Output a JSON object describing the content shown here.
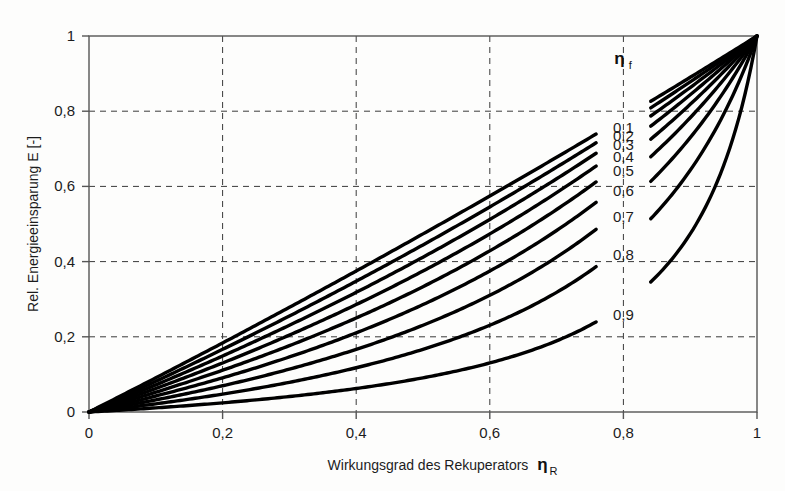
{
  "chart_data": {
    "type": "line",
    "title": "",
    "xlabel": "Wirkungsgrad des Rekuperators",
    "xlabel_symbol": "η",
    "xlabel_symbol_sub": "R",
    "ylabel": "Rel. Energieeinsparung E [-]",
    "legend_symbol": "η",
    "legend_symbol_sub": "f",
    "legend_position": "inline-at-x-0.8",
    "grid": true,
    "grid_style": "dashed",
    "xlim": [
      0,
      1
    ],
    "ylim": [
      0,
      1
    ],
    "xticks": [
      0,
      0.2,
      0.4,
      0.6,
      0.8,
      1
    ],
    "yticks": [
      0,
      0.2,
      0.4,
      0.6,
      0.8,
      1
    ],
    "xticklabels": [
      "0",
      "0,2",
      "0,4",
      "0,6",
      "0,8",
      "1"
    ],
    "yticklabels": [
      "0",
      "0,2",
      "0,4",
      "0,6",
      "0,8",
      "1"
    ],
    "x": [
      0,
      0.05,
      0.1,
      0.15,
      0.2,
      0.25,
      0.3,
      0.35,
      0.4,
      0.45,
      0.5,
      0.55,
      0.6,
      0.65,
      0.7,
      0.75,
      0.8,
      0.85,
      0.9,
      0.95,
      1
    ],
    "series": [
      {
        "name": "0,1",
        "eta_f": 0.1,
        "color": "#000000",
        "values": [
          0,
          0.452,
          0.677,
          0.81,
          0.898,
          0.96,
          1.0,
          1.0,
          1.0,
          1.0,
          1.0,
          1.0,
          1.0,
          1.0,
          1.0,
          1.0,
          1.0,
          1.0,
          1.0,
          1.0,
          1.0
        ],
        "values_plotted": [
          0,
          0.452,
          0.673,
          0.793,
          0.878,
          0.928,
          0.96,
          0.985,
          1.0,
          1.0,
          1.0,
          1.0,
          1.0,
          1.0,
          1.0,
          1.0,
          1.0,
          1.0,
          1.0,
          1.0,
          1.0
        ],
        "value_at_1": 0.9,
        "value_at_0_8": 0.783
      },
      {
        "name": "0,2",
        "eta_f": 0.2,
        "color": "#000000",
        "value_at_1": 0.8,
        "value_at_0_8": 0.762
      },
      {
        "name": "0,3",
        "eta_f": 0.3,
        "color": "#000000",
        "value_at_1": 0.7,
        "value_at_0_8": 0.736
      },
      {
        "name": "0,4",
        "eta_f": 0.4,
        "color": "#000000",
        "value_at_1": 0.6,
        "value_at_0_8": 0.706
      },
      {
        "name": "0,5",
        "eta_f": 0.5,
        "color": "#000000",
        "value_at_1": 0.5,
        "value_at_0_8": 0.667
      },
      {
        "name": "0,6",
        "eta_f": 0.6,
        "color": "#000000",
        "value_at_1": 0.4,
        "value_at_0_8": 0.615
      },
      {
        "name": "0,7",
        "eta_f": 0.7,
        "color": "#000000",
        "value_at_1": 0.3,
        "value_at_0_8": 0.545
      },
      {
        "name": "0,8",
        "eta_f": 0.8,
        "color": "#000000",
        "value_at_1": 0.2,
        "value_at_0_8": 0.444
      },
      {
        "name": "0,9",
        "eta_f": 0.9,
        "color": "#000000",
        "value_at_1": 0.1,
        "value_at_0_8": 0.286
      }
    ],
    "formula": "E = ηR(1-ηf)/(1-ηR·ηf)",
    "annotations": [
      {
        "text": "0,1",
        "x": 0.8,
        "y": 0.783
      },
      {
        "text": "0,2",
        "x": 0.8,
        "y": 0.762
      },
      {
        "text": "0,3",
        "x": 0.8,
        "y": 0.736
      },
      {
        "text": "0,4",
        "x": 0.8,
        "y": 0.706
      },
      {
        "text": "0,5",
        "x": 0.8,
        "y": 0.667
      },
      {
        "text": "0,6",
        "x": 0.8,
        "y": 0.615
      },
      {
        "text": "0,7",
        "x": 0.8,
        "y": 0.545
      },
      {
        "text": "0,8",
        "x": 0.8,
        "y": 0.444
      },
      {
        "text": "0,9",
        "x": 0.8,
        "y": 0.286
      }
    ]
  },
  "plot_geometry": {
    "left": 89,
    "right": 757,
    "top": 36,
    "bottom": 412
  },
  "colors": {
    "curve": "#000000",
    "axis": "#555555",
    "grid": "#3a3a3a",
    "background": "#fdfdfc",
    "text": "#1c1c1c"
  }
}
